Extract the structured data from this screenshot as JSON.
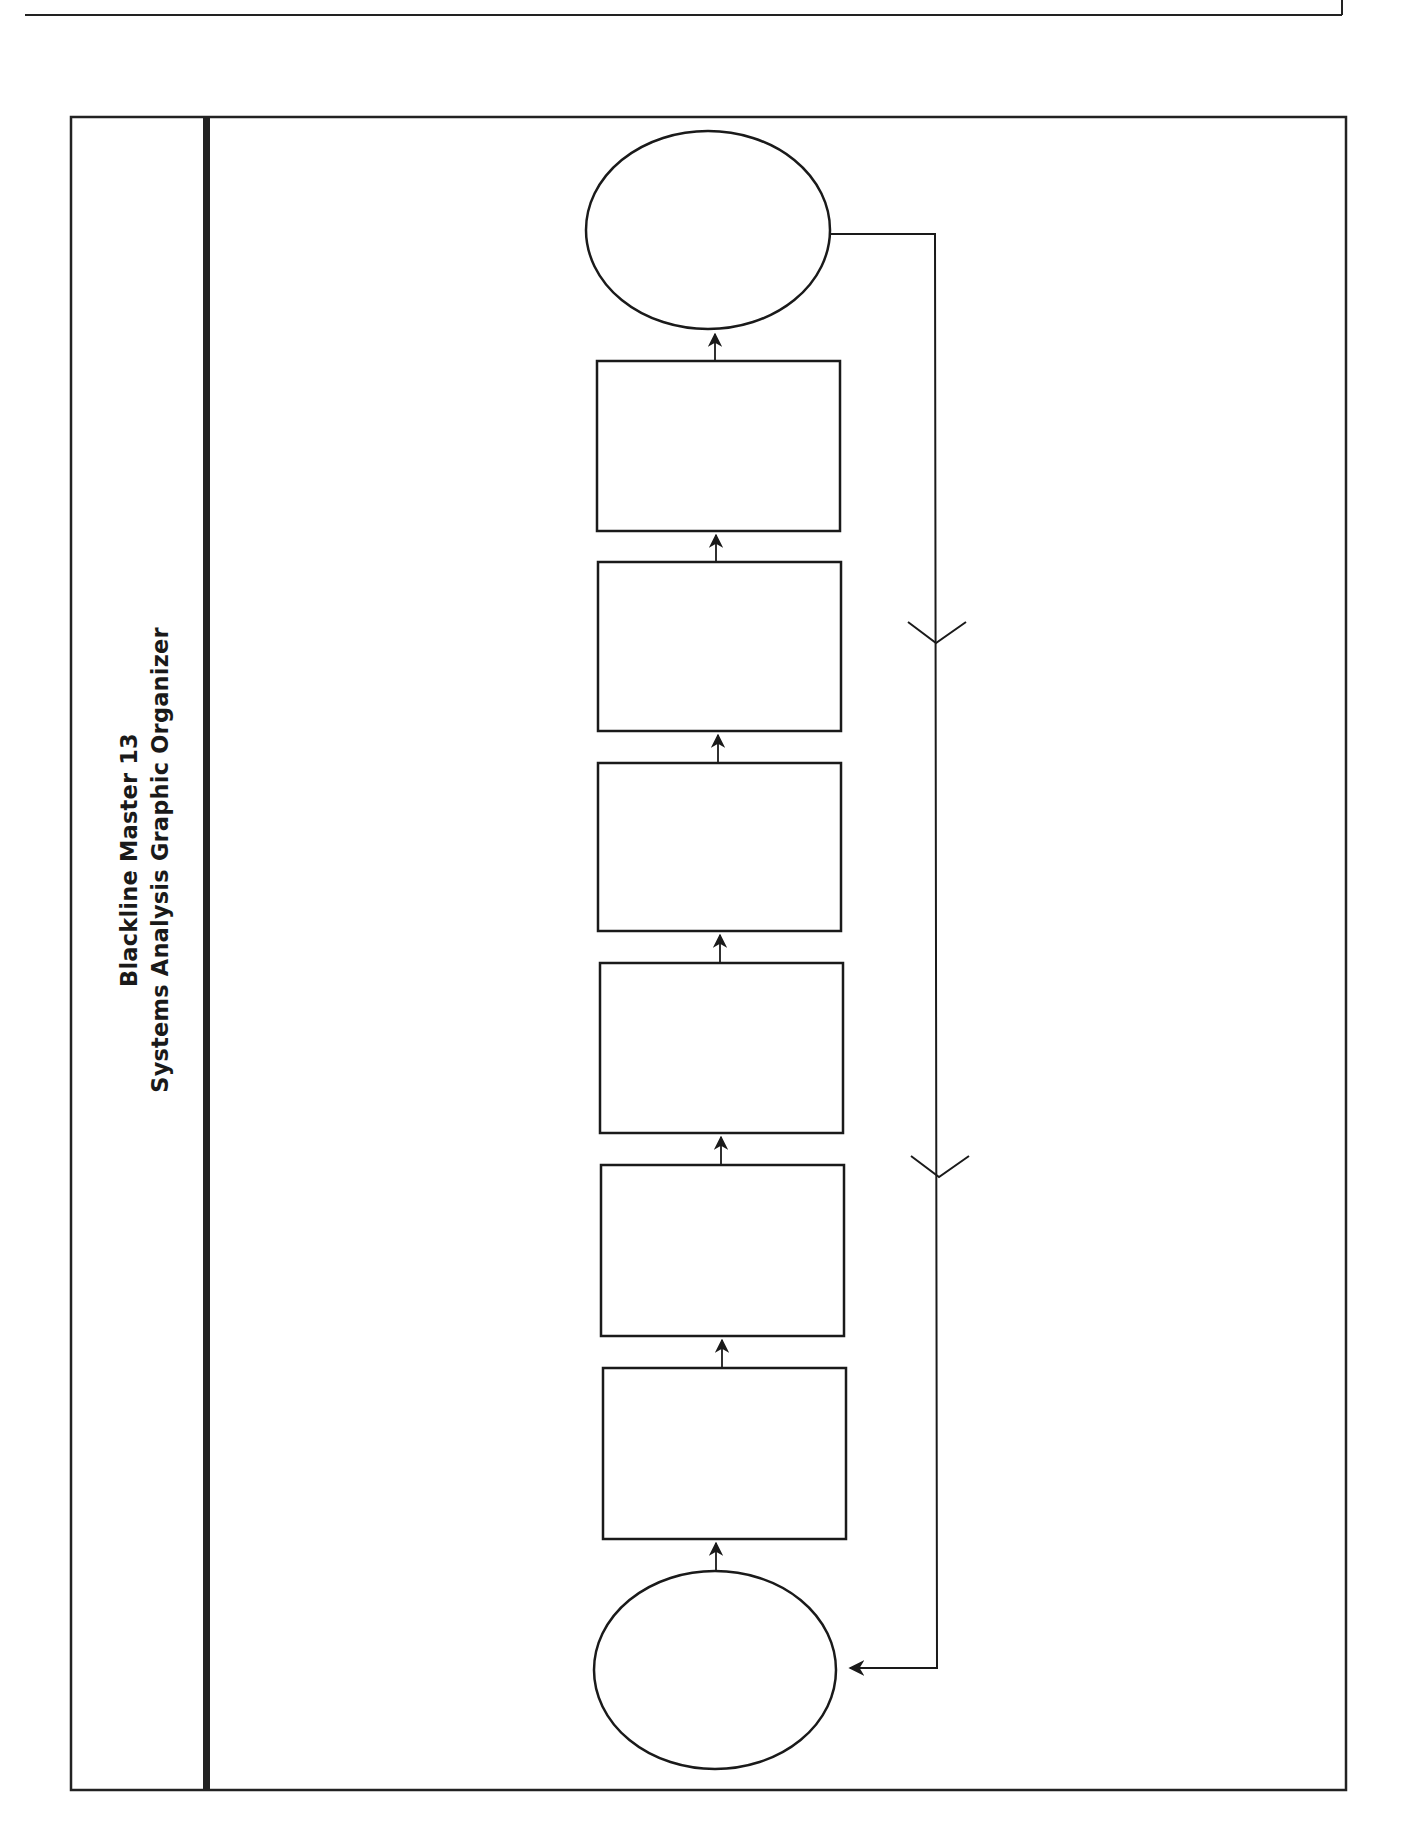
{
  "page": {
    "title_line_1": "Blackline Master 13",
    "title_line_2": "Systems Analysis Graphic Organizer"
  },
  "diagram": {
    "type": "flowchart",
    "orientation": "bottom-to-top",
    "stroke_color": "#1a1a1a",
    "background": "#ffffff",
    "nodes": [
      {
        "id": "input-ellipse",
        "shape": "ellipse",
        "label": ""
      },
      {
        "id": "step-1",
        "shape": "rectangle",
        "label": ""
      },
      {
        "id": "step-2",
        "shape": "rectangle",
        "label": ""
      },
      {
        "id": "step-3",
        "shape": "rectangle",
        "label": ""
      },
      {
        "id": "step-4",
        "shape": "rectangle",
        "label": ""
      },
      {
        "id": "step-5",
        "shape": "rectangle",
        "label": ""
      },
      {
        "id": "step-6",
        "shape": "rectangle",
        "label": ""
      },
      {
        "id": "output-ellipse",
        "shape": "ellipse",
        "label": ""
      }
    ],
    "edges": [
      {
        "from": "input-ellipse",
        "to": "step-1"
      },
      {
        "from": "step-1",
        "to": "step-2"
      },
      {
        "from": "step-2",
        "to": "step-3"
      },
      {
        "from": "step-3",
        "to": "step-4"
      },
      {
        "from": "step-4",
        "to": "step-5"
      },
      {
        "from": "step-5",
        "to": "step-6"
      },
      {
        "from": "step-6",
        "to": "output-ellipse"
      },
      {
        "from": "output-ellipse",
        "to": "input-ellipse",
        "kind": "feedback-loop"
      }
    ]
  }
}
